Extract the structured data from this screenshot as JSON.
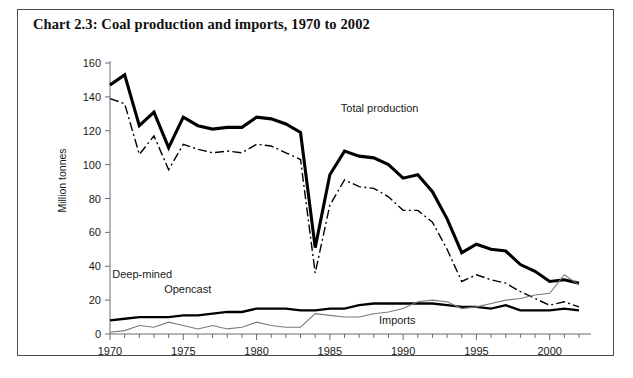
{
  "figure": {
    "title": "Chart 2.3: Coal production and imports, 1970 to 2002",
    "border_color": "#4a4a4a",
    "background": "#ffffff"
  },
  "chart_data": {
    "type": "line",
    "title": "Chart 2.3: Coal production and imports, 1970 to 2002",
    "xlabel": "",
    "ylabel": "Million tonnes",
    "xlim": [
      1970,
      2002
    ],
    "ylim": [
      0,
      160
    ],
    "ytick_values": [
      0,
      20,
      40,
      60,
      80,
      100,
      120,
      140,
      160
    ],
    "ytick_labels": [
      "0",
      "20",
      "40",
      "60",
      "80",
      "100",
      "120",
      "140",
      "160"
    ],
    "xtick_values": [
      1970,
      1975,
      1980,
      1985,
      1990,
      1995,
      2000
    ],
    "xtick_labels": [
      "1970",
      "1975",
      "1980",
      "1985",
      "1990",
      "1995",
      "2000"
    ],
    "xminor_step": 1,
    "grid": false,
    "legend": "inline-annotations",
    "x": [
      1970,
      1971,
      1972,
      1973,
      1974,
      1975,
      1976,
      1977,
      1978,
      1979,
      1980,
      1981,
      1982,
      1983,
      1984,
      1985,
      1986,
      1987,
      1988,
      1989,
      1990,
      1991,
      1992,
      1993,
      1994,
      1995,
      1996,
      1997,
      1998,
      1999,
      2000,
      2001,
      2002
    ],
    "series": [
      {
        "name": "Total production",
        "label": "Total production",
        "style": "solid-thick",
        "color": "#000000",
        "line_width": 3.1,
        "label_x": 1988.4,
        "label_y": 131,
        "values": [
          147,
          153,
          123,
          131,
          110,
          128,
          123,
          121,
          122,
          122,
          128,
          127,
          124,
          119,
          51,
          94,
          108,
          105,
          104,
          100,
          92,
          94,
          84,
          68,
          48,
          53,
          50,
          49,
          41,
          37,
          31,
          32,
          30
        ]
      },
      {
        "name": "Deep-mined",
        "label": "Deep-mined",
        "style": "dash-dot",
        "color": "#000000",
        "line_width": 1.4,
        "label_x": 1972.2,
        "label_y": 33,
        "values": [
          139,
          136,
          106,
          117,
          97,
          112,
          109,
          107,
          108,
          107,
          112,
          111,
          107,
          103,
          36,
          76,
          91,
          87,
          86,
          81,
          73,
          73,
          66,
          50,
          31,
          35,
          32,
          30,
          25,
          21,
          17,
          19,
          16
        ]
      },
      {
        "name": "Opencast",
        "label": "Opencast",
        "style": "solid-medium",
        "color": "#000000",
        "line_width": 2.3,
        "label_x": 1975.3,
        "label_y": 24,
        "values": [
          8,
          9,
          10,
          10,
          10,
          11,
          11,
          12,
          13,
          13,
          15,
          15,
          15,
          14,
          14,
          15,
          15,
          17,
          18,
          18,
          18,
          18,
          18,
          17,
          16,
          16,
          15,
          17,
          14,
          14,
          14,
          15,
          14
        ]
      },
      {
        "name": "Imports",
        "label": "Imports",
        "style": "solid-thin",
        "color": "#7a7a7a",
        "line_width": 1.1,
        "label_x": 1989.6,
        "label_y": 6,
        "values": [
          1,
          2,
          5,
          4,
          7,
          5,
          3,
          5,
          3,
          4,
          7,
          5,
          4,
          4,
          12,
          11,
          10,
          10,
          12,
          13,
          15,
          19,
          20,
          19,
          15,
          16,
          18,
          20,
          21,
          23,
          24,
          35,
          29
        ]
      }
    ]
  },
  "axes": {
    "y_axis_title": "Million tonnes"
  }
}
